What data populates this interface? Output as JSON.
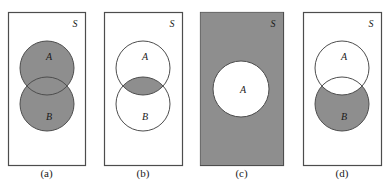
{
  "figure": {
    "background_color": "#ffffff",
    "shade_color": "#8e8e8e",
    "outline_color": "#4d4d4d",
    "label_color": "#1a1a1a"
  },
  "panels": [
    {
      "id": "a",
      "caption": "(a)",
      "universe_label": "S",
      "set_labels": {
        "a": "A",
        "b": "B"
      },
      "shaded_region": "A union B",
      "rect": {
        "x": 8,
        "y": 12,
        "width": 77,
        "height": 153
      },
      "circle_a": {
        "cx": 47,
        "cy": 68,
        "r": 27
      },
      "circle_b": {
        "cx": 47,
        "cy": 104,
        "r": 27
      },
      "rect_filled": false
    },
    {
      "id": "b",
      "caption": "(b)",
      "universe_label": "S",
      "set_labels": {
        "a": "A",
        "b": "B"
      },
      "shaded_region": "A intersect B",
      "rect": {
        "x": 104,
        "y": 12,
        "width": 78,
        "height": 153
      },
      "circle_a": {
        "cx": 143,
        "cy": 68,
        "r": 27
      },
      "circle_b": {
        "cx": 143,
        "cy": 104,
        "r": 27
      },
      "rect_filled": false
    },
    {
      "id": "c",
      "caption": "(c)",
      "universe_label": "S",
      "set_labels": {
        "a": "A",
        "b": ""
      },
      "shaded_region": "complement of A",
      "rect": {
        "x": 200,
        "y": 12,
        "width": 83,
        "height": 153
      },
      "circle_a": {
        "cx": 241,
        "cy": 89,
        "r": 28
      },
      "circle_b": null,
      "rect_filled": true
    },
    {
      "id": "d",
      "caption": "(d)",
      "universe_label": "S",
      "set_labels": {
        "a": "A",
        "b": "B"
      },
      "shaded_region": "B minus A",
      "rect": {
        "x": 303,
        "y": 12,
        "width": 78,
        "height": 153
      },
      "circle_a": {
        "cx": 342,
        "cy": 68,
        "r": 27
      },
      "circle_b": {
        "cx": 342,
        "cy": 104,
        "r": 27
      },
      "rect_filled": false
    }
  ]
}
